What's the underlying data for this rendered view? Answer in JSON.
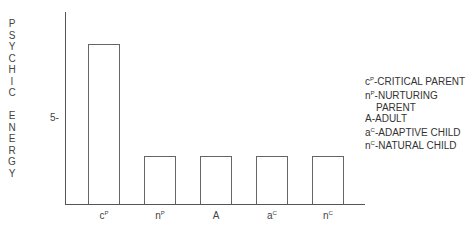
{
  "chart_data": {
    "type": "bar",
    "title": "",
    "xlabel": "",
    "ylabel": "PSYCHIC ENERGY",
    "categories": [
      "cP",
      "nP",
      "A",
      "aC",
      "nC"
    ],
    "category_display": [
      {
        "base": "c",
        "sup": "P"
      },
      {
        "base": "n",
        "sup": "P"
      },
      {
        "base": "A",
        "sup": ""
      },
      {
        "base": "a",
        "sup": "C"
      },
      {
        "base": "n",
        "sup": "C"
      }
    ],
    "values": [
      9.3,
      2.8,
      2.8,
      2.8,
      2.8
    ],
    "yticks": [
      5
    ],
    "ytick_labels": [
      "5-"
    ],
    "ylim": [
      0,
      11
    ],
    "grid": false,
    "legend_position": "right",
    "legend": [
      {
        "base": "c",
        "sup": "P",
        "text": "-CRITICAL PARENT"
      },
      {
        "base": "n",
        "sup": "P",
        "text": "-NURTURING"
      },
      {
        "base": "",
        "sup": "",
        "text": "PARENT",
        "indent": true
      },
      {
        "base": "A",
        "sup": "",
        "text": "-ADULT"
      },
      {
        "base": "a",
        "sup": "C",
        "text": "-ADAPTIVE CHILD"
      },
      {
        "base": "n",
        "sup": "C",
        "text": "-NATURAL CHILD"
      }
    ]
  },
  "ylabel_letters": [
    "P",
    "S",
    "Y",
    "C",
    "H",
    "I",
    "C",
    " ",
    "E",
    "N",
    "E",
    "R",
    "G",
    "Y"
  ],
  "colors": {
    "axis": "#555555",
    "bar_stroke": "#666666",
    "bar_fill": "#ffffff",
    "text": "#333333"
  }
}
